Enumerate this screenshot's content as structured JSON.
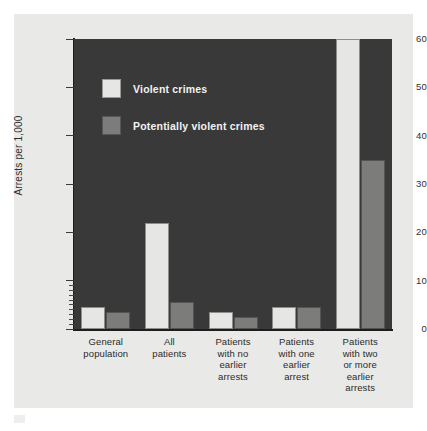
{
  "chart_data": {
    "type": "bar",
    "title": "",
    "xlabel": "",
    "ylabel": "Arrests per 1,000",
    "ylim": [
      0,
      60
    ],
    "yticks": [
      0,
      10,
      20,
      30,
      40,
      50,
      60
    ],
    "ytick_labels": [
      "0",
      "10",
      "20",
      "30",
      "40",
      "50",
      "60"
    ],
    "grid": false,
    "legend_position": "upper-left-inside",
    "categories": [
      "General\npopulation",
      "All\npatients",
      "Patients\nwith no\nearlier\narrests",
      "Patients\nwith one\nearlier\narrest",
      "Patients\nwith two\nor more\nearlier\narrests"
    ],
    "series": [
      {
        "name": "Violent crimes",
        "color": "#e6e6e4",
        "values": [
          4.5,
          22.0,
          3.5,
          4.5,
          62.0
        ]
      },
      {
        "name": "Potentially violent crimes",
        "color": "#7c7c7a",
        "values": [
          3.5,
          5.5,
          2.5,
          4.5,
          35.0
        ]
      }
    ]
  },
  "axis": {
    "y_title": "Arrests per 1,000",
    "ticks": [
      {
        "value": 60,
        "label": "60"
      },
      {
        "value": 50,
        "label": "50"
      },
      {
        "value": 40,
        "label": "40"
      },
      {
        "value": 30,
        "label": "30"
      },
      {
        "value": 20,
        "label": "20"
      },
      {
        "value": 10,
        "label": "10"
      },
      {
        "value": 0,
        "label": "0"
      }
    ]
  },
  "legend": {
    "items": [
      {
        "label": "Violent crimes",
        "swatch": "light"
      },
      {
        "label": "Potentially violent crimes",
        "swatch": "gray"
      }
    ]
  },
  "categories": [
    {
      "lines": [
        "General",
        "population"
      ]
    },
    {
      "lines": [
        "All",
        "patients"
      ]
    },
    {
      "lines": [
        "Patients",
        "with no",
        "earlier",
        "arrests"
      ]
    },
    {
      "lines": [
        "Patients",
        "with one",
        "earlier",
        "arrest"
      ]
    },
    {
      "lines": [
        "Patients",
        "with two",
        "or more",
        "earlier",
        "arrests"
      ]
    }
  ],
  "colors": {
    "plot_background": "#393939",
    "page_background": "#e9e9e7",
    "violent_crimes": "#e6e6e4",
    "potentially_violent_crimes": "#7c7c7a",
    "axis": "#1d1d1d"
  }
}
